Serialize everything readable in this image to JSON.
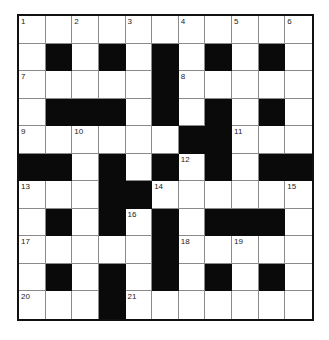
{
  "puzzle": {
    "rows": 11,
    "cols": 11,
    "colors": {
      "block": "#0a0a0a",
      "open": "#ffffff",
      "gridline": "#8a8a8a",
      "border": "#111111"
    },
    "layout": [
      "...........",
      ".#.#.#.#.#.",
      ".....#.....",
      ".###.#.#.#.",
      "......##...",
      "##.#.#.#.##",
      "...##......",
      ".#.#.#.###.",
      ".....#.....",
      ".#.#.#.#.#.",
      "...#......."
    ],
    "layout_note": "# = black square, . = white square",
    "numbers": [
      {
        "row": 0,
        "col": 0,
        "n": "1"
      },
      {
        "row": 0,
        "col": 2,
        "n": "2"
      },
      {
        "row": 0,
        "col": 4,
        "n": "3"
      },
      {
        "row": 0,
        "col": 6,
        "n": "4"
      },
      {
        "row": 0,
        "col": 8,
        "n": "5"
      },
      {
        "row": 0,
        "col": 10,
        "n": "6"
      },
      {
        "row": 2,
        "col": 0,
        "n": "7"
      },
      {
        "row": 2,
        "col": 6,
        "n": "8"
      },
      {
        "row": 4,
        "col": 0,
        "n": "9"
      },
      {
        "row": 4,
        "col": 2,
        "n": "10"
      },
      {
        "row": 4,
        "col": 8,
        "n": "11"
      },
      {
        "row": 5,
        "col": 6,
        "n": "12"
      },
      {
        "row": 6,
        "col": 0,
        "n": "13"
      },
      {
        "row": 6,
        "col": 5,
        "n": "14"
      },
      {
        "row": 6,
        "col": 10,
        "n": "15"
      },
      {
        "row": 7,
        "col": 4,
        "n": "16"
      },
      {
        "row": 8,
        "col": 0,
        "n": "17"
      },
      {
        "row": 8,
        "col": 6,
        "n": "18"
      },
      {
        "row": 8,
        "col": 8,
        "n": "19"
      },
      {
        "row": 10,
        "col": 0,
        "n": "20"
      },
      {
        "row": 10,
        "col": 4,
        "n": "21"
      }
    ]
  }
}
